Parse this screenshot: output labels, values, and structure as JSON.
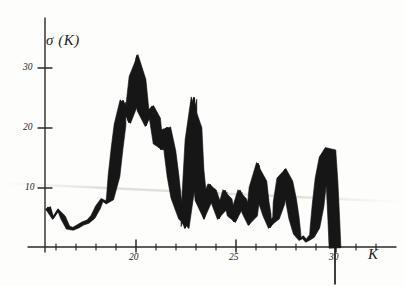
{
  "figure": {
    "title": "",
    "background_color": "#fdfdfc",
    "ink_color": "#141414"
  },
  "axes": {
    "y_label": "σ (K)",
    "x_label": "K",
    "y_ticks": [
      "10",
      "20",
      "30"
    ],
    "x_ticks": [
      "20",
      "25",
      "30"
    ],
    "y_tick_values": [
      10,
      20,
      30
    ],
    "x_tick_values": [
      20,
      25,
      30
    ]
  },
  "chart_data": {
    "type": "line",
    "title": "",
    "xlabel": "K",
    "ylabel": "σ (K)",
    "xlim": [
      15.0,
      31.5
    ],
    "ylim": [
      0,
      35
    ],
    "grid": false,
    "legend": null,
    "style": "hand-drawn thick jagged spectrum trace",
    "x_tick_labels": [
      "20",
      "25",
      "30"
    ],
    "y_tick_labels": [
      "10",
      "20",
      "30"
    ],
    "x_minor_tick_interval": 1,
    "series": [
      {
        "name": "σ (K)",
        "x": [
          15.6,
          15.85,
          16.1,
          16.35,
          16.6,
          16.85,
          17.1,
          17.35,
          17.6,
          17.85,
          18.1,
          18.3,
          18.5,
          18.7,
          18.9,
          19.05,
          19.2,
          19.35,
          19.5,
          19.65,
          19.8,
          19.95,
          20.05,
          20.2,
          20.35,
          20.5,
          20.65,
          20.8,
          20.95,
          21.1,
          21.25,
          21.4,
          21.55,
          21.7,
          21.85,
          22.0,
          22.15,
          22.3,
          22.45,
          22.6,
          22.75,
          22.9,
          23.0,
          23.1,
          23.25,
          23.4,
          23.55,
          23.7,
          23.85,
          24.0,
          24.15,
          24.3,
          24.45,
          24.6,
          24.75,
          24.9,
          25.05,
          25.2,
          25.35,
          25.5,
          25.65,
          25.8,
          25.95,
          26.1,
          26.25,
          26.4,
          26.55,
          26.7,
          26.85,
          27.0,
          27.15,
          27.3,
          27.45,
          27.6,
          27.75,
          27.9,
          28.05,
          28.2,
          28.35,
          28.5,
          28.65,
          28.8,
          28.95,
          29.1,
          29.25,
          29.4,
          29.55,
          29.7,
          29.8,
          29.9,
          29.95
        ],
        "y": [
          6.7,
          5.0,
          6.3,
          5.1,
          3.4,
          3.2,
          3.6,
          4.1,
          4.4,
          5.2,
          6.8,
          8.0,
          7.6,
          8.2,
          12.0,
          16.5,
          20.5,
          24.5,
          23.0,
          21.0,
          24.0,
          28.5,
          32.0,
          28.0,
          23.0,
          20.5,
          22.5,
          23.5,
          21.5,
          17.5,
          16.5,
          19.5,
          20.0,
          16.0,
          12.0,
          8.5,
          6.5,
          5.0,
          3.4,
          9.0,
          18.0,
          25.0,
          20.0,
          13.0,
          8.0,
          5.0,
          8.0,
          10.5,
          9.5,
          7.5,
          5.0,
          6.5,
          9.5,
          8.0,
          5.5,
          4.5,
          6.5,
          9.5,
          8.0,
          6.0,
          4.0,
          5.5,
          10.0,
          14.0,
          11.0,
          7.5,
          5.5,
          3.5,
          4.5,
          5.0,
          7.5,
          11.5,
          13.0,
          11.0,
          8.0,
          5.0,
          2.5,
          1.5,
          1.8,
          1.2,
          1.6,
          2.0,
          3.5,
          7.0,
          11.5,
          15.0,
          16.5,
          16.2,
          11.0,
          4.0,
          0.0
        ],
        "peaks": [
          {
            "x": 20.05,
            "y": 32.0,
            "label": "global maximum"
          },
          {
            "x": 22.9,
            "y": 25.0,
            "label": "sharp narrow spike"
          },
          {
            "x": 19.35,
            "y": 24.5
          },
          {
            "x": 20.8,
            "y": 23.5
          },
          {
            "x": 21.55,
            "y": 20.0
          },
          {
            "x": 26.1,
            "y": 14.0
          },
          {
            "x": 27.45,
            "y": 13.0
          },
          {
            "x": 29.7,
            "y": 16.5,
            "label": "final peak"
          }
        ],
        "minima": [
          {
            "x": 16.85,
            "y": 3.2
          },
          {
            "x": 22.45,
            "y": 3.4
          },
          {
            "x": 23.4,
            "y": 5.0
          },
          {
            "x": 26.7,
            "y": 3.5
          },
          {
            "x": 28.2,
            "y": 1.5
          },
          {
            "x": 28.5,
            "y": 1.2
          }
        ]
      }
    ],
    "annotations": [
      {
        "kind": "vertical-drop-line",
        "x": 29.95,
        "y_from": 4.0,
        "y_to": -6.0
      }
    ]
  }
}
